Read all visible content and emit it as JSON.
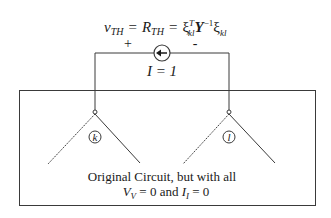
{
  "equation": {
    "lhs": "v",
    "lhs_sub": "TH",
    "eq1": "=",
    "mid": "R",
    "mid_sub": "TH",
    "eq2": "=",
    "xi1": "ξ",
    "xi1_sup": "T",
    "xi1_sub": "kl",
    "y": "Y",
    "y_sup": "−1",
    "xi2": "ξ",
    "xi2_sub": "kl"
  },
  "source": {
    "plus_label": "+",
    "minus_label": "-",
    "current_label": "I = 1",
    "direction": "left"
  },
  "nodes": {
    "left_label": "k",
    "right_label": "l"
  },
  "caption": {
    "line1": "Original Circuit, but with all",
    "line2_v": "V",
    "line2_v_sub": "V",
    "line2_mid": " = 0 and ",
    "line2_i": "I",
    "line2_i_sub": "I",
    "line2_end": " = 0"
  },
  "colors": {
    "line": "#3a3a3a",
    "text": "#1a1a1a",
    "background": "#ffffff"
  }
}
